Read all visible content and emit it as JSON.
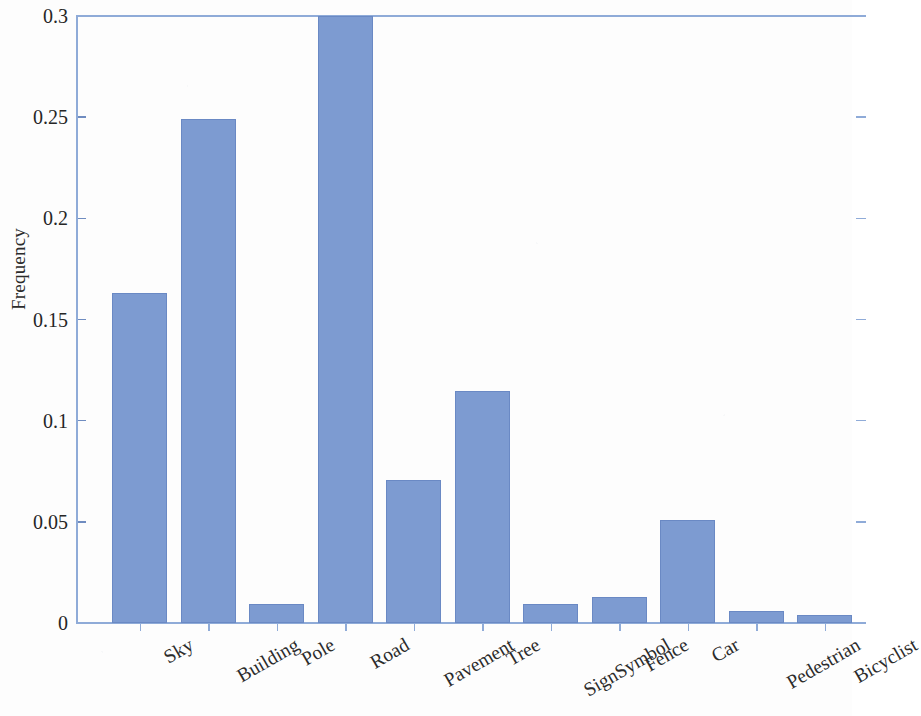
{
  "chart_data": {
    "type": "bar",
    "title": "",
    "subtitle": "",
    "xlabel": "",
    "ylabel": "Frequency",
    "categories": [
      "Sky",
      "Building",
      "Pole",
      "Road",
      "Pavement",
      "Tree",
      "SignSymbol",
      "Fence",
      "Car",
      "Pedestrian",
      "Bicyclist"
    ],
    "values": [
      0.163,
      0.249,
      0.0095,
      0.3,
      0.0705,
      0.1147,
      0.0095,
      0.0128,
      0.0508,
      0.0059,
      0.0039
    ],
    "ylim": [
      0,
      0.3
    ],
    "xlim_note": "categorical, 11 bars, plot frame extends past right image edge",
    "ytick_labels": [
      "0",
      "0.05",
      "0.1",
      "0.15",
      "0.2",
      "0.25",
      "0.3"
    ],
    "ytick_values": [
      0,
      0.05,
      0.1,
      0.15,
      0.2,
      0.25,
      0.3
    ],
    "grid": false,
    "legend": null,
    "bar_color": "#7d9bd1",
    "bar_edge_color": "#6a89c4",
    "axis_color": "#8fabd8",
    "text_color": "#2b2b2b",
    "xtick_label_rotation_deg": -30
  }
}
